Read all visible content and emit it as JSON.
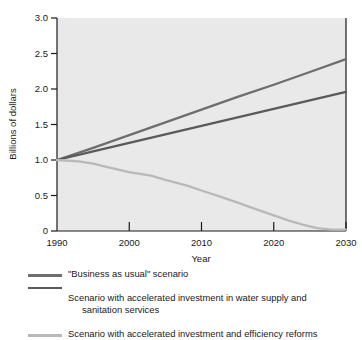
{
  "chart_data": {
    "type": "line",
    "title": "",
    "xlabel": "Year",
    "ylabel": "Billions of dollars",
    "xlim": [
      1990,
      2030
    ],
    "ylim": [
      0,
      3.0
    ],
    "grid": false,
    "legend_position": "below",
    "x_ticks": [
      "1990",
      "2000",
      "2010",
      "2020",
      "2030"
    ],
    "x_tick_values": [
      1990,
      2000,
      2010,
      2020,
      2030
    ],
    "y_ticks": [
      "0",
      "0.5",
      "1.0",
      "1.5",
      "2.0",
      "2.5",
      "3.0"
    ],
    "y_tick_values": [
      0,
      0.5,
      1.0,
      1.5,
      2.0,
      2.5,
      3.0
    ],
    "series": [
      {
        "name": "\"Business as usual\" scenario",
        "color": "#6e6e6e",
        "x": [
          1990,
          1995,
          2000,
          2005,
          2010,
          2015,
          2020,
          2025,
          2030
        ],
        "values": [
          1.0,
          1.17,
          1.35,
          1.53,
          1.71,
          1.89,
          2.06,
          2.24,
          2.42
        ]
      },
      {
        "name": "Scenario with accelerated investment in water supply and sanitation services",
        "color": "#5a5a5a",
        "x": [
          1990,
          1995,
          2000,
          2005,
          2010,
          2015,
          2020,
          2025,
          2030
        ],
        "values": [
          1.0,
          1.12,
          1.24,
          1.36,
          1.48,
          1.6,
          1.72,
          1.84,
          1.96
        ]
      },
      {
        "name": "Scenario with accelerated investment and efficiency reforms",
        "color": "#b9b9b9",
        "x": [
          1990,
          1993,
          1995,
          1997,
          2000,
          2003,
          2005,
          2008,
          2010,
          2013,
          2015,
          2018,
          2020,
          2022,
          2024,
          2026,
          2028,
          2030
        ],
        "values": [
          1.0,
          0.98,
          0.95,
          0.9,
          0.83,
          0.78,
          0.72,
          0.64,
          0.57,
          0.47,
          0.4,
          0.29,
          0.22,
          0.15,
          0.09,
          0.04,
          0.02,
          0.02
        ]
      }
    ]
  },
  "legend": {
    "items": [
      {
        "label": "\"Business as usual\" scenario",
        "label_line2": "",
        "color": "#6e6e6e"
      },
      {
        "label": "Scenario with accelerated investment in water supply and",
        "label_line2": "sanitation services",
        "color": "#5a5a5a"
      },
      {
        "label": "Scenario with accelerated investment and efficiency reforms",
        "label_line2": "",
        "color": "#b9b9b9"
      }
    ]
  },
  "axes": {
    "y_title": "Billions of dollars",
    "x_title": "Year",
    "y_labels": [
      "3.0",
      "2.5",
      "2.0",
      "1.5",
      "1.0",
      "0.5",
      "0"
    ],
    "x_labels": [
      "1990",
      "2000",
      "2010",
      "2020",
      "2030"
    ]
  },
  "style": {
    "plot_background": "#e9e9e9",
    "axis_color": "#1a1a1a",
    "page_background": "#ffffff"
  }
}
